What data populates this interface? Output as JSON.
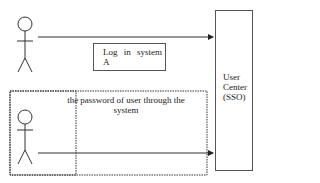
{
  "diagram": {
    "type": "sequence",
    "actors": [
      {
        "id": "actor-top",
        "label": ""
      },
      {
        "id": "actor-bottom",
        "label": ""
      }
    ],
    "lifeline": {
      "label_lines": [
        "User",
        "Center",
        "(SSO)"
      ]
    },
    "messages": [
      {
        "from": "actor-top",
        "to": "user-center",
        "label_lines": [
          "Log  in  system",
          "A"
        ]
      },
      {
        "from": "actor-bottom",
        "to": "user-center",
        "label_lines": [
          "the password of user through the",
          "system"
        ]
      }
    ],
    "group": {
      "style": "dotted",
      "contains": [
        "actor-bottom",
        "message-2"
      ]
    }
  }
}
